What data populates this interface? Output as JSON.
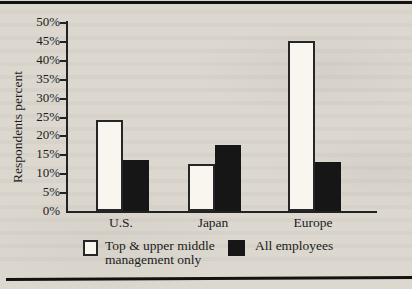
{
  "figure": {
    "background_color": "#dcd8d0",
    "rule_color": "#121212",
    "axis_color": "#222222",
    "text_color": "#1b1b1b"
  },
  "chart_data": {
    "type": "bar",
    "title": "",
    "xlabel": "",
    "ylabel": "Respondents percent",
    "categories": [
      "U.S.",
      "Japan",
      "Europe"
    ],
    "series": [
      {
        "key": "top-upper-middle-management-only",
        "name": "Top & upper middle management only",
        "fill": "#f8f6ef",
        "border": "#262626",
        "values": [
          24,
          12.5,
          45
        ]
      },
      {
        "key": "all-employees",
        "name": "All employees",
        "fill": "#161616",
        "border": "#161616",
        "values": [
          13.5,
          17.5,
          13
        ]
      }
    ],
    "ylim": [
      0,
      50
    ],
    "ytick_step": 5,
    "ytick_labels": [
      "0%",
      "5%",
      "10%",
      "15%",
      "20%",
      "25%",
      "30%",
      "35%",
      "40%",
      "45%",
      "50%"
    ],
    "grid": false,
    "legend_position": "bottom"
  }
}
